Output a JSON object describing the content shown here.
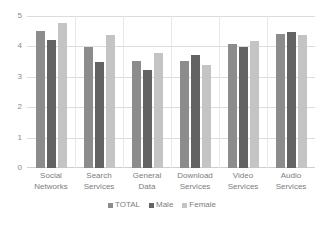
{
  "chart_data": {
    "type": "bar",
    "title": "",
    "subtitle": "",
    "xlabel": "",
    "ylabel": "",
    "ylim": [
      0,
      5
    ],
    "yticks": [
      "0",
      "1",
      "2",
      "3",
      "4",
      "5"
    ],
    "grid": true,
    "legend_position": "bottom",
    "categories": [
      "Social Networks",
      "Search Services",
      "General Data",
      "Download Services",
      "Video Services",
      "Audio Services"
    ],
    "category_lines": [
      [
        "Social",
        "Networks"
      ],
      [
        "Search",
        "Services"
      ],
      [
        "General",
        "Data"
      ],
      [
        "Download",
        "Services"
      ],
      [
        "Video",
        "Services"
      ],
      [
        "Audio",
        "Services"
      ]
    ],
    "series": [
      {
        "name": "TOTAL",
        "color": "#8c8c8c",
        "values": [
          4.55,
          4.0,
          3.55,
          3.55,
          4.12,
          4.45
        ]
      },
      {
        "name": "Male",
        "color": "#636363",
        "values": [
          4.25,
          3.5,
          3.25,
          3.75,
          4.0,
          4.5
        ]
      },
      {
        "name": "Female",
        "color": "#c4c4c4",
        "values": [
          4.8,
          4.4,
          3.8,
          3.4,
          4.2,
          4.4
        ]
      }
    ]
  },
  "legend": {
    "items": [
      {
        "label": "TOTAL"
      },
      {
        "label": "Male"
      },
      {
        "label": "Female"
      }
    ]
  }
}
